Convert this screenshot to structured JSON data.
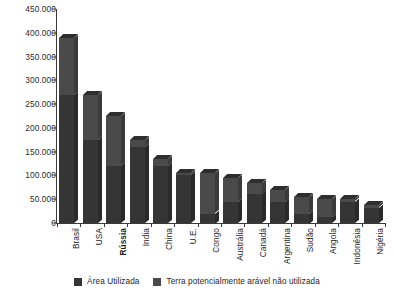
{
  "chart_data": {
    "type": "bar",
    "subtype": "stacked-bar-3d",
    "title": "",
    "subtitle": "",
    "xlabel": "",
    "ylabel": "",
    "ylim": [
      0,
      450000
    ],
    "ytick_step": 50000,
    "grid": false,
    "legend_position": "bottom-center",
    "number_format": "pt-BR thousands separator '.'",
    "categories": [
      "Brasil",
      "USA",
      "Rússia",
      "India",
      "China",
      "U.E.",
      "Congo",
      "Austrália",
      "Canadá",
      "Argentina",
      "Sudão",
      "Angola",
      "Indonésia",
      "Nigéria"
    ],
    "series": [
      {
        "name": "Área Utilizada",
        "color": "#353535",
        "values": [
          270000,
          175000,
          120000,
          160000,
          120000,
          100000,
          20000,
          45000,
          60000,
          45000,
          20000,
          12000,
          45000,
          32000
        ]
      },
      {
        "name": "Terra potencialmente arável não utilizada",
        "color": "#4a4a4a",
        "values": [
          120000,
          95000,
          105000,
          15000,
          15000,
          5000,
          85000,
          50000,
          25000,
          25000,
          35000,
          38000,
          5000,
          5000
        ]
      }
    ],
    "totals": [
      390000,
      270000,
      225000,
      175000,
      135000,
      105000,
      105000,
      95000,
      85000,
      70000,
      55000,
      50000,
      50000,
      37000
    ],
    "ytick_labels": [
      "0",
      "50.000",
      "100.000",
      "150.000",
      "200.000",
      "250.000",
      "300.000",
      "350.000",
      "400.000",
      "450.000"
    ],
    "ytick_values": [
      0,
      50000,
      100000,
      150000,
      200000,
      250000,
      300000,
      350000,
      400000,
      450000
    ]
  },
  "legend": {
    "items": [
      {
        "label": "Área Utilizada",
        "color": "#353535"
      },
      {
        "label": "Terra potencialmente arável não utilizada",
        "color": "#4a4a4a"
      }
    ]
  }
}
